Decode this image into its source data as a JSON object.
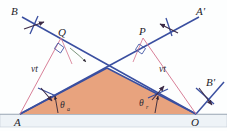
{
  "figure": {
    "width": 227,
    "height": 131,
    "background_color": "#fdfefe"
  },
  "colors": {
    "ray_blue": "#3a4fa0",
    "construction_pink": "#d4728c",
    "wedge_fill": "#e8a37e",
    "wedge_stroke": "#3a4fa0",
    "ground_fill": "#eef2f6",
    "ground_stroke": "#b9c2cc",
    "marker_dark": "#3b2a46",
    "label_color": "#1d1d2b"
  },
  "labels": {
    "incident_ray_start": "B",
    "reflected_ray_end": "A'",
    "incident_ray_end": "A'",
    "point_q": "Q",
    "point_p": "P",
    "point_a": "A",
    "point_o": "O",
    "outgoing_ray": "B'",
    "distance_left": "vt",
    "distance_right": "vt",
    "angle_incidence_symbol": "θ",
    "angle_incidence_subscript": "a",
    "angle_reflection_symbol": "θ",
    "angle_reflection_subscript": "r"
  },
  "geometry": {
    "point_a": {
      "x": 20,
      "y": 114
    },
    "point_o": {
      "x": 196,
      "y": 114
    },
    "apex": {
      "x": 107,
      "y": 68
    },
    "point_q": {
      "x": 61,
      "y": 38
    },
    "point_p": {
      "x": 143,
      "y": 38
    },
    "ground_top_y": 114,
    "ground_bottom_y": 127
  },
  "annotations": {
    "wavefront_marker_count": 4,
    "right_angle_markers": 2,
    "angle_arc_markers": 2
  }
}
